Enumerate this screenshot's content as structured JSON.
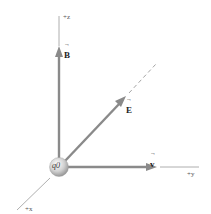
{
  "diagram": {
    "type": "3d-coordinate-vector-diagram",
    "axes": {
      "z": {
        "label": "+z"
      },
      "y": {
        "label": "+y"
      },
      "x": {
        "label": "+x"
      }
    },
    "charge": {
      "label": "q0"
    },
    "vectors": {
      "B": {
        "label": "B",
        "direction": "+z"
      },
      "E": {
        "label": "E",
        "direction": "diagonal (in y-z plane)"
      },
      "v": {
        "label": "v",
        "direction": "+y"
      }
    },
    "arrow_glyph": "→",
    "colors": {
      "vector": "#8a8a8a",
      "axis": "#9a9a9a",
      "sphere_light": "#f2f2f2",
      "sphere_dark": "#9c9c9c",
      "text": "#333333"
    }
  }
}
